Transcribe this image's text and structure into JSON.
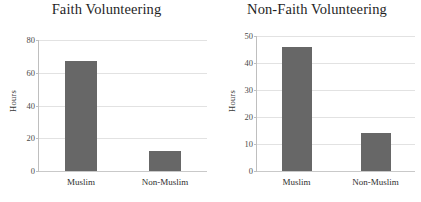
{
  "figure": {
    "ylabel": "Hours",
    "bar_color": "#676767",
    "gridline_color": "#e2e2e2",
    "axis_color": "#bfbfbf"
  },
  "chart_data": [
    {
      "type": "bar",
      "title": "Faith Volunteering",
      "categories": [
        "Muslim",
        "Non-Muslim"
      ],
      "values": [
        67,
        12
      ],
      "xlabel": "",
      "ylabel": "Hours",
      "ylim": [
        0,
        80
      ],
      "yticks": [
        0,
        20,
        40,
        60,
        80
      ],
      "grid": true,
      "legend": "none"
    },
    {
      "type": "bar",
      "title": "Non-Faith Volunteering",
      "categories": [
        "Muslim",
        "Non-Muslim"
      ],
      "values": [
        46,
        14
      ],
      "xlabel": "",
      "ylabel": "Hours",
      "ylim": [
        0,
        50
      ],
      "yticks": [
        0,
        10,
        20,
        30,
        40,
        50
      ],
      "grid": true,
      "legend": "none"
    }
  ]
}
